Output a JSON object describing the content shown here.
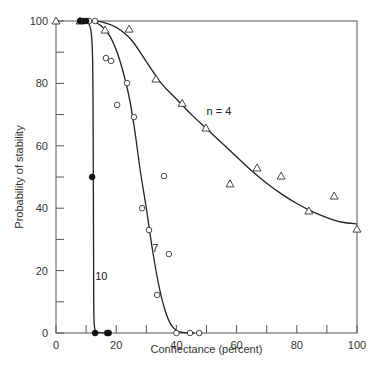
{
  "chart_data": {
    "type": "scatter",
    "title": "",
    "xlabel": "Connectance (percent)",
    "ylabel": "Probability of stability",
    "xlim": [
      0,
      100
    ],
    "ylim": [
      0,
      100
    ],
    "grid": false,
    "x_ticks": [
      0,
      20,
      40,
      60,
      80,
      100
    ],
    "x_minor_ticks": [
      10,
      30,
      50,
      70,
      90
    ],
    "y_ticks": [
      0,
      20,
      40,
      60,
      80,
      100
    ],
    "y_minor_ticks": [
      10,
      30,
      50,
      70,
      90
    ],
    "series": [
      {
        "name": "n = 4",
        "label": "n = 4",
        "marker": "open-triangle",
        "points": [
          [
            0,
            100
          ],
          [
            8,
            100
          ],
          [
            16.3,
            97.1
          ],
          [
            24.3,
            97.4
          ],
          [
            33.2,
            81.4
          ],
          [
            41.9,
            73.6
          ],
          [
            49.8,
            65.7
          ],
          [
            57.8,
            47.8
          ],
          [
            66.8,
            52.9
          ],
          [
            74.8,
            50.3
          ],
          [
            84,
            39.1
          ],
          [
            92.4,
            43.9
          ],
          [
            100,
            33.3
          ]
        ],
        "curve": [
          [
            12,
            100
          ],
          [
            16,
            99.5
          ],
          [
            20,
            98
          ],
          [
            25,
            94
          ],
          [
            30,
            87
          ],
          [
            35,
            80
          ],
          [
            40,
            75
          ],
          [
            45,
            70
          ],
          [
            50,
            65.5
          ],
          [
            55,
            61
          ],
          [
            60,
            56.5
          ],
          [
            65,
            52
          ],
          [
            70,
            48
          ],
          [
            75,
            44.5
          ],
          [
            80,
            41.5
          ],
          [
            85,
            39
          ],
          [
            90,
            37
          ],
          [
            95,
            35.5
          ],
          [
            100,
            35
          ]
        ]
      },
      {
        "name": "7",
        "label": "7",
        "marker": "open-circle",
        "points": [
          [
            11,
            100
          ],
          [
            13,
            100
          ],
          [
            16.6,
            88.1
          ],
          [
            18.3,
            87.2
          ],
          [
            23.6,
            80.1
          ],
          [
            20.3,
            73.1
          ],
          [
            25.9,
            69.2
          ],
          [
            35.9,
            50.3
          ],
          [
            28.6,
            40
          ],
          [
            30.9,
            33
          ],
          [
            37.5,
            25.3
          ],
          [
            33.6,
            12.2
          ],
          [
            40,
            0
          ],
          [
            44.5,
            0
          ],
          [
            47.6,
            0
          ]
        ],
        "curve": [
          [
            12,
            100
          ],
          [
            15,
            98.5
          ],
          [
            18,
            95
          ],
          [
            21,
            88
          ],
          [
            24,
            77
          ],
          [
            26,
            66
          ],
          [
            28,
            52
          ],
          [
            30,
            40
          ],
          [
            32,
            27
          ],
          [
            34,
            16
          ],
          [
            36,
            8
          ],
          [
            38,
            3
          ],
          [
            40,
            0.8
          ],
          [
            42,
            0.2
          ],
          [
            46,
            0
          ]
        ]
      },
      {
        "name": "10",
        "label": "10",
        "marker": "filled-circle",
        "points": [
          [
            8,
            100
          ],
          [
            9,
            100
          ],
          [
            10,
            100
          ],
          [
            12,
            50
          ],
          [
            13,
            0
          ],
          [
            17,
            0
          ],
          [
            17.5,
            0
          ]
        ],
        "curve": [
          [
            10.5,
            100
          ],
          [
            11.6,
            97
          ],
          [
            12.1,
            90
          ],
          [
            12.3,
            75
          ],
          [
            12.4,
            50
          ],
          [
            12.5,
            20
          ],
          [
            12.6,
            5
          ],
          [
            13,
            1
          ],
          [
            14,
            0.2
          ],
          [
            18,
            0
          ]
        ]
      }
    ],
    "annotations": [
      {
        "text": "n = 4",
        "x": 50,
        "y": 70
      },
      {
        "text": "7",
        "x": 32,
        "y": 26
      },
      {
        "text": "10",
        "x": 13,
        "y": 17
      }
    ]
  }
}
